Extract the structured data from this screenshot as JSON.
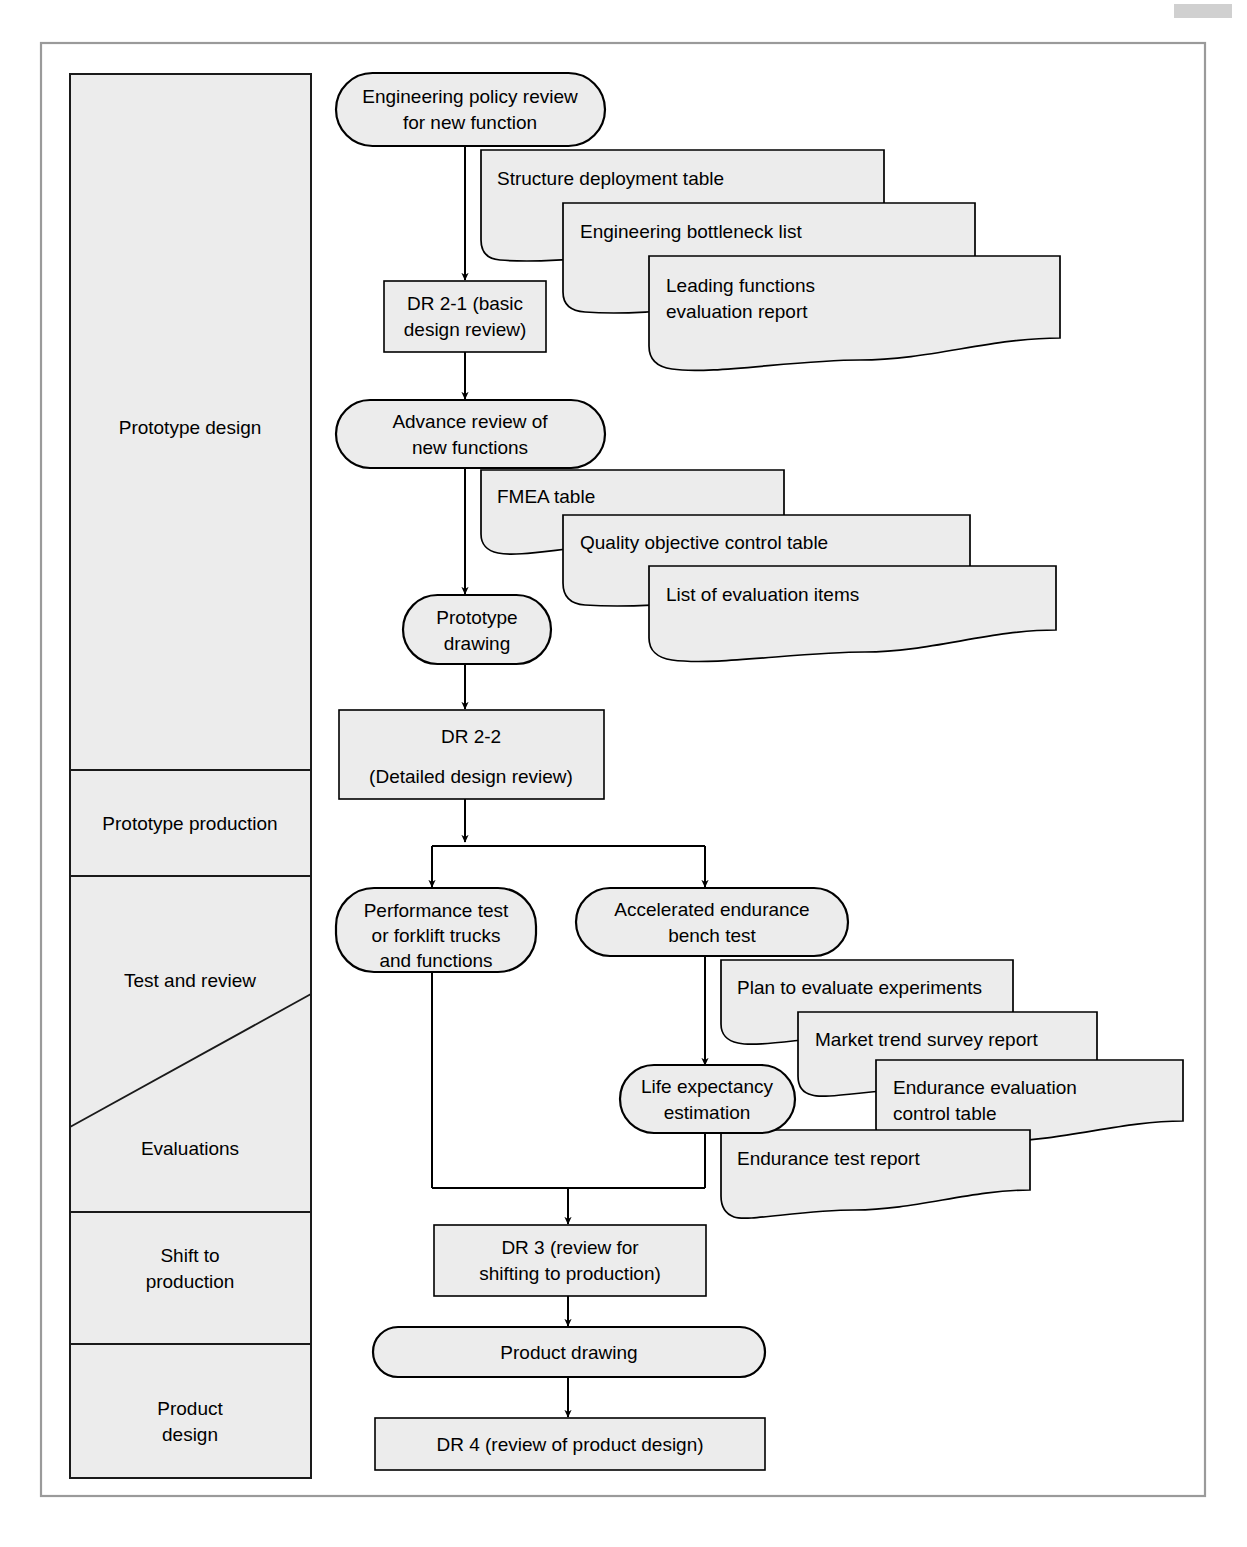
{
  "diagram": {
    "colors": {
      "shape_fill": "#ececec",
      "stroke": "#000000",
      "frame": "#9a9a9a",
      "page_background": "#ffffff"
    },
    "lanes": [
      {
        "id": "prototype-design",
        "label": "Prototype design"
      },
      {
        "id": "prototype-production",
        "label": "Prototype production"
      },
      {
        "id": "test-and-review",
        "label": "Test and review"
      },
      {
        "id": "evaluations",
        "label": "Evaluations"
      },
      {
        "id": "shift-to-production",
        "label": "Shift to\nproduction"
      },
      {
        "id": "product-design",
        "label": "Product\ndesign"
      }
    ],
    "nodes": [
      {
        "id": "engineering-policy-review",
        "shape": "stadium",
        "label": "Engineering policy review\nfor new function"
      },
      {
        "id": "dr-2-1",
        "shape": "rect",
        "label": "DR 2-1 (basic\ndesign review)"
      },
      {
        "id": "advance-review",
        "shape": "stadium",
        "label": "Advance review of\nnew functions"
      },
      {
        "id": "prototype-drawing",
        "shape": "stadium",
        "label": "Prototype\ndrawing"
      },
      {
        "id": "dr-2-2",
        "shape": "rect",
        "label": "DR 2-2\n(Detailed design review)"
      },
      {
        "id": "performance-test",
        "shape": "stadium",
        "label": "Performance test\nor forklift trucks\nand functions"
      },
      {
        "id": "accelerated-endurance-bench-test",
        "shape": "stadium",
        "label": "Accelerated endurance\nbench test"
      },
      {
        "id": "life-expectancy-estimation",
        "shape": "stadium",
        "label": "Life expectancy\nestimation"
      },
      {
        "id": "dr-3",
        "shape": "rect",
        "label": "DR 3 (review for\nshifting to production)"
      },
      {
        "id": "product-drawing",
        "shape": "stadium",
        "label": "Product drawing"
      },
      {
        "id": "dr-4",
        "shape": "rect",
        "label": "DR 4 (review of product design)"
      }
    ],
    "documents": [
      {
        "id": "structure-deployment-table",
        "label": "Structure deployment table",
        "attached_to": "engineering-policy-review"
      },
      {
        "id": "engineering-bottleneck-list",
        "label": "Engineering bottleneck list",
        "attached_to": "engineering-policy-review"
      },
      {
        "id": "leading-functions-evaluation-report",
        "label": "Leading functions\nevaluation report",
        "attached_to": "engineering-policy-review"
      },
      {
        "id": "fmea-table",
        "label": "FMEA table",
        "attached_to": "advance-review"
      },
      {
        "id": "quality-objective-control-table",
        "label": "Quality objective control table",
        "attached_to": "advance-review"
      },
      {
        "id": "list-of-evaluation-items",
        "label": "List of evaluation items",
        "attached_to": "advance-review"
      },
      {
        "id": "plan-to-evaluate-experiments",
        "label": "Plan to evaluate experiments",
        "attached_to": "accelerated-endurance-bench-test"
      },
      {
        "id": "market-trend-survey-report",
        "label": "Market trend survey report",
        "attached_to": "accelerated-endurance-bench-test"
      },
      {
        "id": "endurance-evaluation-control-table",
        "label": "Endurance evaluation\ncontrol table",
        "attached_to": "accelerated-endurance-bench-test"
      },
      {
        "id": "endurance-test-report",
        "label": "Endurance test report",
        "attached_to": "life-expectancy-estimation"
      }
    ],
    "node_text": {
      "engineering_policy_review_l1": "Engineering policy review",
      "engineering_policy_review_l2": "for new function",
      "dr_2_1_l1": "DR 2-1 (basic",
      "dr_2_1_l2": "design review)",
      "advance_review_l1": "Advance review of",
      "advance_review_l2": "new functions",
      "prototype_drawing_l1": "Prototype",
      "prototype_drawing_l2": "drawing",
      "dr_2_2_l1": "DR 2-2",
      "dr_2_2_l2": "(Detailed design review)",
      "performance_test_l1": "Performance test",
      "performance_test_l2": "or forklift trucks",
      "performance_test_l3": "and functions",
      "accelerated_l1": "Accelerated endurance",
      "accelerated_l2": "bench test",
      "life_expectancy_l1": "Life expectancy",
      "life_expectancy_l2": "estimation",
      "dr_3_l1": "DR 3 (review for",
      "dr_3_l2": "shifting to production)",
      "product_drawing": "Product drawing",
      "dr_4": "DR 4 (review of product design)"
    },
    "doc_text": {
      "structure_deployment_table": "Structure deployment table",
      "engineering_bottleneck_list": "Engineering bottleneck list",
      "leading_functions_l1": "Leading functions",
      "leading_functions_l2": "evaluation report",
      "fmea_table": "FMEA table",
      "quality_objective_control_table": "Quality objective control table",
      "list_of_evaluation_items": "List of evaluation items",
      "plan_to_evaluate_experiments": "Plan to evaluate experiments",
      "market_trend_survey_report": "Market trend survey report",
      "endurance_evaluation_l1": "Endurance evaluation",
      "endurance_evaluation_l2": "control table",
      "endurance_test_report": "Endurance test report"
    },
    "lane_text": {
      "prototype_design": "Prototype design",
      "prototype_production": "Prototype production",
      "test_and_review": "Test and review",
      "evaluations": "Evaluations",
      "shift_to_production_l1": "Shift to",
      "shift_to_production_l2": "production",
      "product_design_l1": "Product",
      "product_design_l2": "design"
    }
  }
}
